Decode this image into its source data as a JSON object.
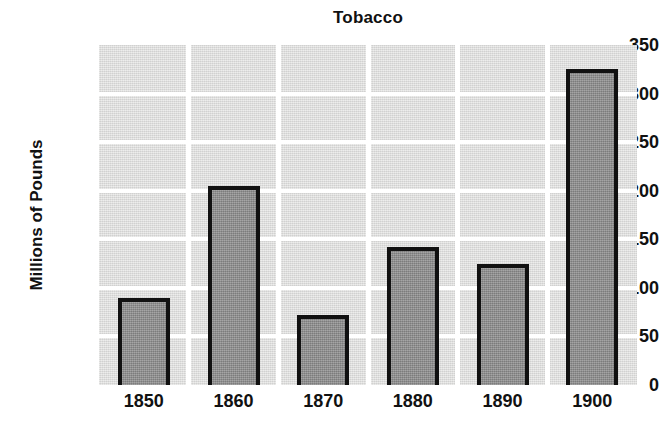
{
  "chart_data": {
    "type": "bar",
    "title": "Tobacco",
    "xlabel": "",
    "ylabel": "Millions of Pounds",
    "categories": [
      "1850",
      "1860",
      "1870",
      "1880",
      "1890",
      "1900"
    ],
    "values": [
      90,
      205,
      72,
      142,
      125,
      325
    ],
    "ylim": [
      0,
      350
    ],
    "yticks": [
      0,
      50,
      100,
      150,
      200,
      250,
      300,
      350
    ],
    "ytick_labels": [
      "0",
      "50",
      "100",
      "150",
      "200",
      "250",
      "300",
      "350"
    ],
    "grid": true,
    "grid_orientation": "both",
    "grid_color": "#ffffff",
    "legend": false,
    "legend_position": "none",
    "bar_fill_color": "#8d8d8d",
    "bar_edge_color": "#111111",
    "plot_background_color": "#dededd",
    "figure_background_color": "#ffffff",
    "text_color": "#111111"
  }
}
